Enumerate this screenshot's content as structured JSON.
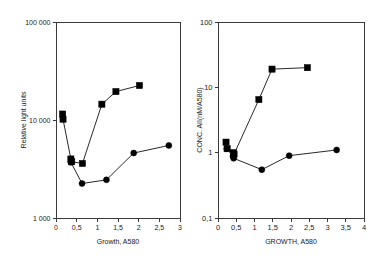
{
  "figure": {
    "background_color": "#ffffff",
    "foreground_color": "#1a1a1a",
    "marker_color": "#000000"
  },
  "chart_data": [
    {
      "type": "line",
      "id": "left-panel",
      "title": "",
      "subtitle": "",
      "xlabel": "Growth, A580",
      "ylabel": "Relative light units",
      "xscale": "linear",
      "yscale": "log",
      "xlim": [
        0,
        3
      ],
      "ylim": [
        1000,
        100000
      ],
      "grid": false,
      "legend": "none",
      "xticks": [
        "0",
        "0,5",
        "1",
        "1,5",
        "2",
        "2,5",
        "3"
      ],
      "xtick_values": [
        0,
        0.5,
        1,
        1.5,
        2,
        2.5,
        3
      ],
      "yticks": [
        "1 000",
        "10 000",
        "100 000"
      ],
      "ytick_values": [
        1000,
        10000,
        100000
      ],
      "series": [
        {
          "name": "squares",
          "marker": "square",
          "x": [
            0.16,
            0.17,
            0.36,
            0.38,
            0.64,
            1.11,
            1.45,
            2.02
          ],
          "y": [
            11500,
            10200,
            4000,
            3750,
            3600,
            14500,
            19500,
            22500
          ]
        },
        {
          "name": "circles",
          "marker": "circle",
          "x": [
            0.36,
            0.63,
            1.22,
            1.88,
            2.73
          ],
          "y": [
            3700,
            2250,
            2450,
            4600,
            5500
          ]
        }
      ]
    },
    {
      "type": "line",
      "id": "right-panel",
      "title": "",
      "subtitle": "",
      "xlabel": "GROWTH, A580",
      "ylabel": "CONC. AII(nM/A580)",
      "xscale": "linear",
      "yscale": "log",
      "xlim": [
        0,
        4
      ],
      "ylim": [
        0.1,
        100
      ],
      "grid": false,
      "legend": "none",
      "xticks": [
        "0",
        "0,5",
        "1",
        "1,5",
        "2",
        "2,5",
        "3",
        "3,5",
        "4"
      ],
      "xtick_values": [
        0,
        0.5,
        1,
        1.5,
        2,
        2.5,
        3,
        3.5,
        4
      ],
      "yticks": [
        "0,1",
        "1",
        "10",
        "100"
      ],
      "ytick_values": [
        0.1,
        1,
        10,
        100
      ],
      "series": [
        {
          "name": "squares",
          "marker": "square",
          "x": [
            0.22,
            0.25,
            0.42,
            0.44,
            1.12,
            1.48,
            2.45
          ],
          "y": [
            1.45,
            1.15,
            1.0,
            0.95,
            6.5,
            19.0,
            20.0
          ]
        },
        {
          "name": "circles",
          "marker": "circle",
          "x": [
            0.24,
            0.41,
            0.43,
            1.2,
            1.95,
            3.25
          ],
          "y": [
            1.15,
            0.88,
            0.82,
            0.55,
            0.9,
            1.1
          ]
        }
      ]
    }
  ]
}
